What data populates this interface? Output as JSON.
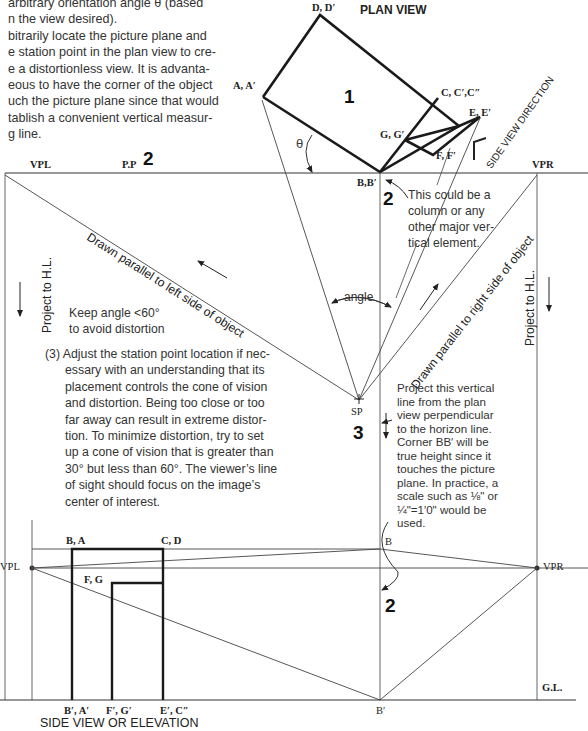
{
  "intro_text": {
    "lines": [
      "arbitrary orientation angle θ (based",
      "n the view desired).",
      "bitrarily locate the picture plane and",
      "e station point in the plan view to cre-",
      "e a distortionless view. It is advanta-",
      "eous to have the corner of the object",
      "uch the picture plane since that would",
      "tablish a convenient vertical measur-",
      "g line."
    ]
  },
  "plan_view": {
    "title": "PLAN VIEW",
    "object_number": "1",
    "labels": {
      "d": "D, D′",
      "a": "A, A′",
      "c": "C, C′,C″",
      "e": "E, E′",
      "g": "G, G′",
      "f": "F, F′",
      "b": "B,B′",
      "theta": "θ"
    },
    "side_view_direction": "SIDE VIEW DIRECTION"
  },
  "picture_plane": {
    "vpl": "VPL",
    "pp": "P.P",
    "step_number": "2",
    "vpr": "VPR"
  },
  "annotations": {
    "column_note": [
      "This could be a",
      "column or any",
      "other major ver-",
      "tical element."
    ],
    "column_step": "2",
    "left_parallel": "Drawn parallel to left side of object",
    "right_parallel": "Drawn parallel to right side of object",
    "project_left": "Project to H.L.",
    "project_right": "Project to H.L.",
    "keep_angle": [
      "Keep angle <60°",
      "to avoid distortion"
    ],
    "angle": "angle",
    "sp": "SP",
    "sp_step": "3",
    "step3_text": [
      "(3) Adjust the station point location if nec-",
      "essary with an understanding that its",
      "placement controls the cone of vision",
      "and distortion. Being too close or too",
      "far away can result in extreme distor-",
      "tion. To minimize distortion, try to set",
      "up a cone of vision that is greater than",
      "30° but less than 60°. The viewer’s line",
      "of sight should focus on the image’s",
      "center of interest."
    ],
    "project_vertical": [
      "Project this vertical",
      "line from the plan",
      "view perpendicular",
      "to the horizon line.",
      "Corner BB′ will be",
      "true height since it",
      "touches the picture",
      "plane. In practice, a",
      "scale such as ⅛\" or",
      "¼\"=1′0\" would be",
      "used."
    ]
  },
  "elevation": {
    "vpl": "VPL",
    "vpr": "VPR",
    "ba": "B, A",
    "cd": "C, D",
    "fg": "F, G",
    "b_top": "B",
    "b_bottom": "B′",
    "step_number": "2",
    "bottom_labels": [
      "B′, A′",
      "F′, G′",
      "E′, C″"
    ],
    "gl": "G.L.",
    "title": "SIDE VIEW OR ELEVATION"
  }
}
